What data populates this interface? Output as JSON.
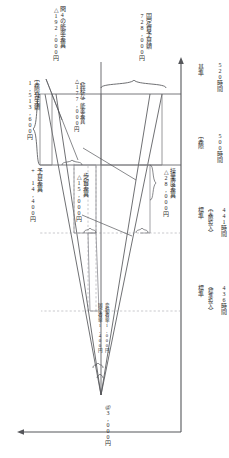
{
  "diagram": {
    "type": "standard-cost-variance-chart",
    "origin_label": "@3,000円",
    "axis": {
      "x_axis_name": "操業度（時間）",
      "y_axis_name": "金額（円）",
      "ticks": [
        {
          "id": "standard-standard-input",
          "heading": "標準",
          "sub": "（標準投入）",
          "value": "436時間"
        },
        {
          "id": "standard-actual-input",
          "heading": "標準",
          "sub": "（実際投入）",
          "value": "441時間"
        },
        {
          "id": "actual",
          "heading": "実際",
          "sub": "",
          "value": "500時間"
        },
        {
          "id": "normal",
          "heading": "基準",
          "sub": "",
          "value": "520時間"
        }
      ]
    },
    "rates": [
      {
        "id": "variable-rate",
        "label": "変動費率1,000円"
      },
      {
        "id": "fixed-rate",
        "label": "固定費率1,400円"
      }
    ],
    "callouts": [
      {
        "id": "actual-cost",
        "line1": "実際発生額",
        "line2": "1,513,600円"
      },
      {
        "id": "fixed-budget",
        "line1": "固定費予算額",
        "line2": "728,000円"
      },
      {
        "id": "efficiency-q4",
        "line1": "問4の能率差異",
        "line2": "△192,000円"
      },
      {
        "id": "pure-efficiency",
        "line1": "（純粋な）能率差異",
        "line2": "△177,000円"
      },
      {
        "id": "budget-variance",
        "line1": "予算差異",
        "line2": "+ 14,400円"
      },
      {
        "id": "yield-variance",
        "line1": "歩留差異",
        "line2": "△15,000円"
      },
      {
        "id": "capacity-variance",
        "line1": "操業度差異",
        "line2": "△28,000円"
      }
    ],
    "colors": {
      "line": "#55565a",
      "dashed": "#9a9aa0",
      "text": "#2b2b2b",
      "background": "#ffffff"
    }
  }
}
